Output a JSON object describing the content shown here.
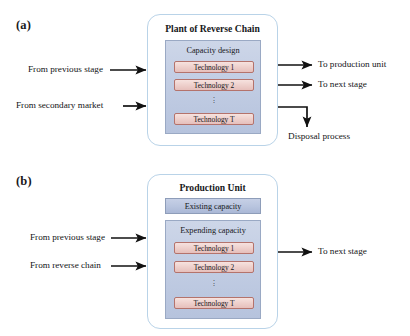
{
  "figure": {
    "panels": [
      {
        "label": "(a)",
        "title": "Plant of Reverse Chain",
        "inner_title": "Capacity design",
        "technologies": [
          "Technology  1",
          "Technology  2",
          "Technology  T"
        ],
        "dots": "⋮",
        "inputs": [
          "From previous stage",
          "From secondary market"
        ],
        "outputs": [
          "To production unit",
          "To next stage",
          "Disposal process"
        ]
      },
      {
        "label": "(b)",
        "title": "Production Unit",
        "existing_capacity": "Existing  capacity",
        "inner_title": "Expending  capacity",
        "technologies": [
          "Technology  1",
          "Technology  2",
          "Technology  T"
        ],
        "dots": "⋮",
        "inputs": [
          "From previous stage",
          "From reverse chain"
        ],
        "outputs": [
          "To next stage"
        ]
      }
    ]
  },
  "colors": {
    "outer_border": "#b9d3e8",
    "inner_block": "#c3cee4",
    "inner_border": "#9aa9c4",
    "tech_fill": "#efd2ce",
    "tech_border": "#b4736c",
    "capacity_fill": "#b8c4de",
    "arrow": "#111111",
    "background": "#ffffff"
  }
}
